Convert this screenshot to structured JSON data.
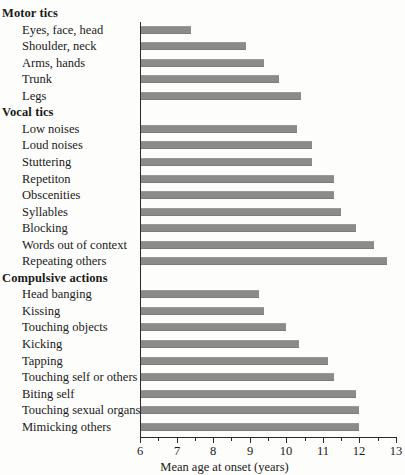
{
  "chart_data": {
    "type": "bar",
    "orientation": "horizontal",
    "title": "",
    "xlabel": "Mean age at onset (years)",
    "ylabel": "",
    "xlim": [
      6,
      13
    ],
    "xticks": [
      6,
      7,
      8,
      9,
      10,
      11,
      12,
      13
    ],
    "xtick_labels": [
      "6",
      "7",
      "8",
      "9",
      "10",
      "11",
      "12",
      "13"
    ],
    "minor_tick_step": 0.5,
    "grid": false,
    "legend": null,
    "bar_color": "#8b8b8b",
    "axis_color": "#2b2b2b",
    "background_color": "#fdfdfb",
    "rows": [
      {
        "label": "Motor tics",
        "type": "group",
        "value": null
      },
      {
        "label": "Eyes, face, head",
        "type": "item",
        "value": 7.4
      },
      {
        "label": "Shoulder, neck",
        "type": "item",
        "value": 8.9
      },
      {
        "label": "Arms, hands",
        "type": "item",
        "value": 9.4
      },
      {
        "label": "Trunk",
        "type": "item",
        "value": 9.8
      },
      {
        "label": "Legs",
        "type": "item",
        "value": 10.4
      },
      {
        "label": "Vocal tics",
        "type": "group",
        "value": null
      },
      {
        "label": "Low noises",
        "type": "item",
        "value": 10.3
      },
      {
        "label": "Loud noises",
        "type": "item",
        "value": 10.7
      },
      {
        "label": "Stuttering",
        "type": "item",
        "value": 10.7
      },
      {
        "label": "Repetiton",
        "type": "item",
        "value": 11.3
      },
      {
        "label": "Obscenities",
        "type": "item",
        "value": 11.3
      },
      {
        "label": "Syllables",
        "type": "item",
        "value": 11.5
      },
      {
        "label": "Blocking",
        "type": "item",
        "value": 11.9
      },
      {
        "label": "Words out of context",
        "type": "item",
        "value": 12.4
      },
      {
        "label": "Repeating others",
        "type": "item",
        "value": 12.75
      },
      {
        "label": "Compulsive actions",
        "type": "group",
        "value": null
      },
      {
        "label": "Head banging",
        "type": "item",
        "value": 9.25
      },
      {
        "label": "Kissing",
        "type": "item",
        "value": 9.4
      },
      {
        "label": "Touching objects",
        "type": "item",
        "value": 10.0
      },
      {
        "label": "Kicking",
        "type": "item",
        "value": 10.35
      },
      {
        "label": "Tapping",
        "type": "item",
        "value": 11.15
      },
      {
        "label": "Touching self or others",
        "type": "item",
        "value": 11.3
      },
      {
        "label": "Biting self",
        "type": "item",
        "value": 11.9
      },
      {
        "label": "Touching sexual organs",
        "type": "item",
        "value": 12.0
      },
      {
        "label": "Mimicking others",
        "type": "item",
        "value": 12.0
      }
    ]
  }
}
